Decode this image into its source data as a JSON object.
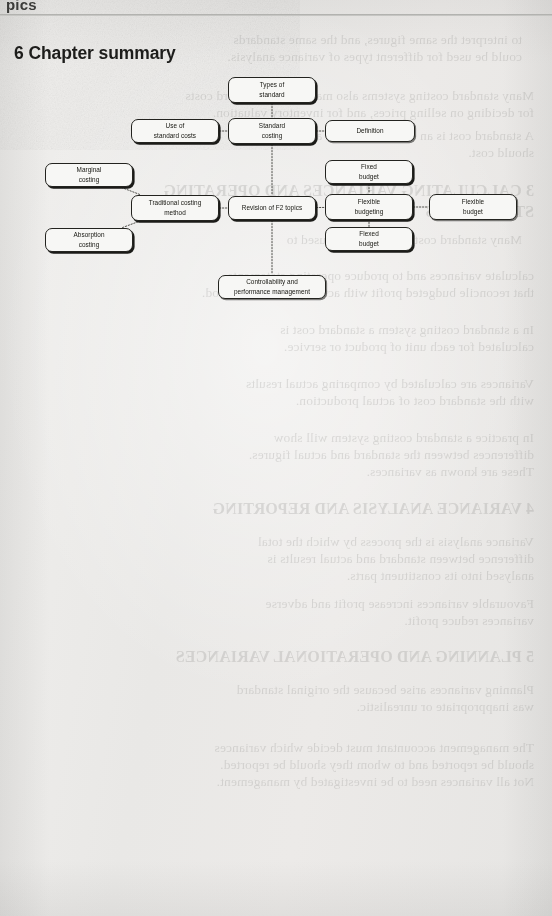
{
  "page": {
    "cutoff_header": "pics",
    "title": "6 Chapter summary",
    "background_color": "#eeeeec",
    "rule_color": "#a9a9a6"
  },
  "diagram": {
    "name": "chapter-summary-mind-map",
    "node_fill": "#f7f7f5",
    "node_border": "#23231f",
    "connector_style": "dotted",
    "nodes": [
      {
        "id": "types-of-standard",
        "label": "Types of\nstandard",
        "x": 228,
        "y": 77,
        "w": 88,
        "h": 26,
        "shadow": "hard"
      },
      {
        "id": "use-of-standard-costs",
        "label": "Use of\nstandard costs",
        "x": 131,
        "y": 119,
        "w": 88,
        "h": 24,
        "shadow": "hard"
      },
      {
        "id": "standard-costing",
        "label": "Standard\ncosting",
        "x": 228,
        "y": 118,
        "w": 88,
        "h": 26,
        "shadow": "hard"
      },
      {
        "id": "definition",
        "label": "Definition",
        "x": 325,
        "y": 120,
        "w": 90,
        "h": 22,
        "shadow": "soft"
      },
      {
        "id": "marginal-costing",
        "label": "Marginal\ncosting",
        "x": 45,
        "y": 163,
        "w": 88,
        "h": 24,
        "shadow": "hard"
      },
      {
        "id": "fixed-budget",
        "label": "Fixed\nbudget",
        "x": 325,
        "y": 160,
        "w": 88,
        "h": 24,
        "shadow": "hard"
      },
      {
        "id": "traditional-costing",
        "label": "Traditional costing\nmethod",
        "x": 131,
        "y": 195,
        "w": 88,
        "h": 26,
        "shadow": "hard"
      },
      {
        "id": "revision-f2-topics",
        "label": "Revision of F2 topics",
        "x": 228,
        "y": 196,
        "w": 88,
        "h": 24,
        "shadow": "hard"
      },
      {
        "id": "flexible-budgeting",
        "label": "Flexible\nbudgeting",
        "x": 325,
        "y": 194,
        "w": 88,
        "h": 26,
        "shadow": "hard"
      },
      {
        "id": "flexible-budget",
        "label": "Flexible\nbudget",
        "x": 429,
        "y": 194,
        "w": 88,
        "h": 26,
        "shadow": "soft"
      },
      {
        "id": "absorption-costing",
        "label": "Absorption\ncosting",
        "x": 45,
        "y": 228,
        "w": 88,
        "h": 24,
        "shadow": "hard"
      },
      {
        "id": "flexed-budget",
        "label": "Flexed\nbudget",
        "x": 325,
        "y": 227,
        "w": 88,
        "h": 24,
        "shadow": "hard"
      },
      {
        "id": "controllability",
        "label": "Controllability and\nperformance management",
        "x": 218,
        "y": 275,
        "w": 108,
        "h": 24,
        "shadow": "soft"
      }
    ],
    "links": [
      {
        "from": "types-of-standard",
        "to": "standard-costing"
      },
      {
        "from": "use-of-standard-costs",
        "to": "standard-costing"
      },
      {
        "from": "standard-costing",
        "to": "definition"
      },
      {
        "from": "standard-costing",
        "to": "revision-f2-topics"
      },
      {
        "from": "marginal-costing",
        "to": "traditional-costing"
      },
      {
        "from": "absorption-costing",
        "to": "traditional-costing"
      },
      {
        "from": "traditional-costing",
        "to": "revision-f2-topics"
      },
      {
        "from": "revision-f2-topics",
        "to": "flexible-budgeting"
      },
      {
        "from": "fixed-budget",
        "to": "flexible-budgeting"
      },
      {
        "from": "flexed-budget",
        "to": "flexible-budgeting"
      },
      {
        "from": "flexible-budgeting",
        "to": "flexible-budget"
      },
      {
        "from": "revision-f2-topics",
        "to": "controllability"
      }
    ]
  },
  "bleed_through": {
    "description": "mirrored ghost text from reverse of scanned page",
    "lines": [
      {
        "t": "to interpret the same figures, and the same standards",
        "x": 30,
        "y": 32,
        "big": false
      },
      {
        "t": "could be used for different types of variance analysis.",
        "x": 30,
        "y": 49,
        "big": false
      },
      {
        "t": "Many standard costing systems also make use of standard costs",
        "x": 18,
        "y": 88,
        "big": false
      },
      {
        "t": "for deciding on selling prices, and for inventory valuation.",
        "x": 18,
        "y": 105,
        "big": false
      },
      {
        "t": "A standard cost is an estimate of what a unit of output",
        "x": 18,
        "y": 128,
        "big": false
      },
      {
        "t": "should cost.",
        "x": 18,
        "y": 145,
        "big": false
      },
      {
        "t": "3 CALCULATING VARIANCES AND OPERATING",
        "x": 18,
        "y": 182,
        "big": true
      },
      {
        "t": "STATEMENTS",
        "x": 18,
        "y": 203,
        "big": true
      },
      {
        "t": "Many standard costing systems are used to",
        "x": 30,
        "y": 232,
        "big": false
      },
      {
        "t": "calculate variances and to produce operating statements",
        "x": 18,
        "y": 268,
        "big": false
      },
      {
        "t": "that reconcile budgeted profit with actual profit for a period.",
        "x": 18,
        "y": 285,
        "big": false
      },
      {
        "t": "In a standard costing system a standard cost is",
        "x": 18,
        "y": 322,
        "big": false
      },
      {
        "t": "calculated for each unit of product or service.",
        "x": 18,
        "y": 339,
        "big": false
      },
      {
        "t": "Variances are calculated by comparing actual results",
        "x": 18,
        "y": 376,
        "big": false
      },
      {
        "t": "with the standard cost of actual production.",
        "x": 18,
        "y": 393,
        "big": false
      },
      {
        "t": "In practice a standard costing system will show",
        "x": 18,
        "y": 430,
        "big": false
      },
      {
        "t": "differences between the standard and actual figures.",
        "x": 18,
        "y": 447,
        "big": false
      },
      {
        "t": "These are known as variances.",
        "x": 18,
        "y": 464,
        "big": false
      },
      {
        "t": "4 VARIANCE ANALYSIS AND REPORTING",
        "x": 18,
        "y": 500,
        "big": true
      },
      {
        "t": "Variance analysis is the process by which the total",
        "x": 18,
        "y": 534,
        "big": false
      },
      {
        "t": "difference between standard and actual results is",
        "x": 18,
        "y": 551,
        "big": false
      },
      {
        "t": "analysed into its constituent parts.",
        "x": 18,
        "y": 568,
        "big": false
      },
      {
        "t": "Favourable variances increase profit and adverse",
        "x": 18,
        "y": 596,
        "big": false
      },
      {
        "t": "variances reduce profit.",
        "x": 18,
        "y": 613,
        "big": false
      },
      {
        "t": "5 PLANNING AND OPERATIONAL VARIANCES",
        "x": 18,
        "y": 648,
        "big": true
      },
      {
        "t": "Planning variances arise because the original standard",
        "x": 18,
        "y": 682,
        "big": false
      },
      {
        "t": "was inappropriate or unrealistic.",
        "x": 18,
        "y": 699,
        "big": false
      },
      {
        "t": "The management accountant must decide which variances",
        "x": 18,
        "y": 740,
        "big": false
      },
      {
        "t": "should be reported and to whom they should be reported.",
        "x": 18,
        "y": 757,
        "big": false
      },
      {
        "t": "Not all variances need to be investigated by management.",
        "x": 18,
        "y": 774,
        "big": false
      }
    ]
  }
}
